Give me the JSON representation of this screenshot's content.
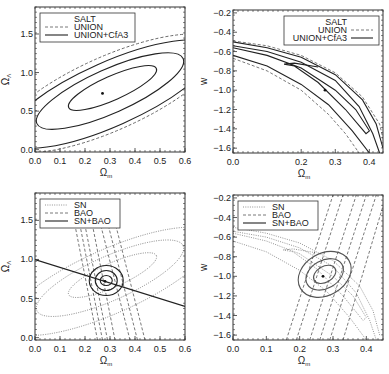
{
  "chart_data": [
    {
      "type": "line",
      "panel": "top-left",
      "title": "",
      "xlabel": "Ωm",
      "ylabel": "ΩΛ",
      "xlim": [
        0.0,
        0.6
      ],
      "ylim": [
        -0.03,
        1.85
      ],
      "xticks": [
        "0.0",
        "0.1",
        "0.2",
        "0.3",
        "0.4",
        "0.5",
        "0.6"
      ],
      "yticks": [
        "0.0",
        "0.5",
        "1.0",
        "1.5"
      ],
      "legend": {
        "position": "upper left",
        "entries": [
          {
            "label": "SALT",
            "style": "none"
          },
          {
            "label": "UNION",
            "style": "dashed"
          },
          {
            "label": "UNION+CfA3",
            "style": "solid"
          }
        ]
      },
      "best_fit": {
        "x": 0.27,
        "y": 0.73
      },
      "contours": [
        {
          "series": "UNION+CfA3",
          "level": "1σ",
          "cx": 0.31,
          "cy": 0.8,
          "half_major": 0.16,
          "half_minor": 0.075,
          "angle_deg": 30
        },
        {
          "series": "UNION+CfA3",
          "level": "2σ",
          "cx": 0.3,
          "cy": 0.76,
          "half_major": 0.3,
          "half_minor": 0.13,
          "angle_deg": 30
        },
        {
          "series": "UNION+CfA3",
          "level": "3σ",
          "cx": 0.3,
          "cy": 0.73,
          "half_major": 0.42,
          "half_minor": 0.19,
          "angle_deg": 30
        },
        {
          "series": "UNION",
          "level": "3σ",
          "cx": 0.3,
          "cy": 0.74,
          "half_major": 0.46,
          "half_minor": 0.21,
          "angle_deg": 30
        }
      ]
    },
    {
      "type": "line",
      "panel": "top-right",
      "xlabel": "Ωm",
      "ylabel": "w",
      "xlim": [
        0.0,
        0.44
      ],
      "ylim": [
        -1.65,
        -0.17
      ],
      "xticks": [
        "0.0",
        "0.2",
        "0.3",
        "0.4"
      ],
      "yticks": [
        "-0.2",
        "-0.4",
        "-0.6",
        "-0.8",
        "-1.0",
        "-1.2",
        "-1.4",
        "-1.6"
      ],
      "legend": {
        "position": "upper right",
        "entries": [
          {
            "label": "SALT",
            "style": "none"
          },
          {
            "label": "UNION",
            "style": "dashed"
          },
          {
            "label": "UNION+CfA3",
            "style": "solid"
          }
        ]
      },
      "best_fit": {
        "x": 0.27,
        "y": -1.0
      },
      "bands": [
        {
          "series": "UNION+CfA3",
          "level": "outer-upper",
          "points": [
            [
              0.0,
              -0.5
            ],
            [
              0.1,
              -0.56
            ],
            [
              0.2,
              -0.66
            ],
            [
              0.3,
              -0.84
            ],
            [
              0.38,
              -1.1
            ],
            [
              0.42,
              -1.35
            ],
            [
              0.44,
              -1.6
            ]
          ]
        },
        {
          "series": "UNION+CfA3",
          "level": "mid-upper",
          "points": [
            [
              0.0,
              -0.54
            ],
            [
              0.1,
              -0.6
            ],
            [
              0.2,
              -0.71
            ],
            [
              0.3,
              -0.9
            ],
            [
              0.37,
              -1.17
            ],
            [
              0.41,
              -1.45
            ],
            [
              0.43,
              -1.65
            ]
          ]
        },
        {
          "series": "UNION+CfA3",
          "level": "mid-lower",
          "points": [
            [
              0.0,
              -0.64
            ],
            [
              0.1,
              -0.75
            ],
            [
              0.2,
              -0.94
            ],
            [
              0.28,
              -1.15
            ],
            [
              0.35,
              -1.42
            ],
            [
              0.4,
              -1.65
            ]
          ]
        },
        {
          "series": "UNION+CfA3",
          "level": "inner",
          "points": [
            [
              0.0,
              -0.56
            ],
            [
              0.1,
              -0.64
            ],
            [
              0.2,
              -0.77
            ],
            [
              0.3,
              -1.0
            ],
            [
              0.36,
              -1.2
            ],
            [
              0.4,
              -1.42
            ],
            [
              0.39,
              -1.45
            ],
            [
              0.33,
              -1.2
            ],
            [
              0.25,
              -0.92
            ],
            [
              0.18,
              -0.75
            ],
            [
              0.15,
              -0.73
            ],
            [
              0.18,
              -0.72
            ],
            [
              0.25,
              -0.76
            ]
          ]
        },
        {
          "series": "UNION",
          "level": "outer-upper",
          "points": [
            [
              0.0,
              -0.49
            ],
            [
              0.1,
              -0.54
            ],
            [
              0.2,
              -0.64
            ],
            [
              0.3,
              -0.82
            ],
            [
              0.38,
              -1.07
            ],
            [
              0.43,
              -1.35
            ],
            [
              0.44,
              -1.5
            ]
          ]
        },
        {
          "series": "UNION",
          "level": "outer-lower",
          "points": [
            [
              0.0,
              -0.67
            ],
            [
              0.1,
              -0.8
            ],
            [
              0.2,
              -1.0
            ],
            [
              0.28,
              -1.25
            ],
            [
              0.33,
              -1.45
            ],
            [
              0.37,
              -1.65
            ]
          ]
        }
      ]
    },
    {
      "type": "line",
      "panel": "bottom-left",
      "xlabel": "Ωm",
      "ylabel": "ΩΛ",
      "xlim": [
        0.0,
        0.6
      ],
      "ylim": [
        -0.03,
        1.85
      ],
      "xticks": [
        "0.0",
        "0.1",
        "0.2",
        "0.3",
        "0.4",
        "0.5",
        "0.6"
      ],
      "yticks": [
        "0.0",
        "0.5",
        "1.0",
        "1.5"
      ],
      "legend": {
        "position": "upper left",
        "entries": [
          {
            "label": "SN",
            "style": "dotted"
          },
          {
            "label": "BAO",
            "style": "dashed"
          },
          {
            "label": "SN+BAO",
            "style": "solid"
          }
        ]
      },
      "best_fit": {
        "x": 0.28,
        "y": 0.72
      },
      "flat_line": {
        "points": [
          [
            0.0,
            1.0
          ],
          [
            0.6,
            0.4
          ]
        ],
        "label": "ΩΛ = 1 - Ωm"
      },
      "bao_bands": [
        {
          "bottom_x": 0.25,
          "top_x": 0.15
        },
        {
          "bottom_x": 0.27,
          "top_x": 0.17
        },
        {
          "bottom_x": 0.29,
          "top_x": 0.19
        },
        {
          "bottom_x": 0.32,
          "top_x": 0.22
        },
        {
          "bottom_x": 0.38,
          "top_x": 0.25
        },
        {
          "bottom_x": 0.41,
          "top_x": 0.28
        },
        {
          "bottom_x": 0.44,
          "top_x": 0.31
        }
      ]
    },
    {
      "type": "line",
      "panel": "bottom-right",
      "xlabel": "Ωm",
      "ylabel": "w",
      "xlim": [
        0.0,
        0.45
      ],
      "ylim": [
        -1.65,
        -0.17
      ],
      "xticks": [
        "0.0",
        "0.1",
        "0.2",
        "0.3",
        "0.4"
      ],
      "yticks": [
        "-0.2",
        "-0.4",
        "-0.6",
        "-0.8",
        "-1.0",
        "-1.2",
        "-1.4",
        "-1.6"
      ],
      "legend": {
        "position": "upper left",
        "entries": [
          {
            "label": "SN",
            "style": "dotted"
          },
          {
            "label": "BAO",
            "style": "dashed"
          },
          {
            "label": "SN+BAO",
            "style": "solid"
          }
        ]
      },
      "best_fit": {
        "x": 0.27,
        "y": -1.0
      },
      "bao_bands": [
        {
          "bottom_x": 0.16,
          "top_x": 0.3
        },
        {
          "bottom_x": 0.19,
          "top_x": 0.33
        },
        {
          "bottom_x": 0.23,
          "top_x": 0.37
        },
        {
          "bottom_x": 0.26,
          "top_x": 0.4
        },
        {
          "bottom_x": 0.29,
          "top_x": 0.43
        },
        {
          "bottom_x": 0.33,
          "top_x": 0.46
        }
      ]
    }
  ],
  "panels": {
    "tl": {
      "ylabel": "ΩΛ",
      "xlabel": "Ωm",
      "legend": [
        "SALT",
        "UNION",
        "UNION+CfA3"
      ]
    },
    "tr": {
      "ylabel": "w",
      "xlabel": "Ωm",
      "legend": [
        "SALT",
        "UNION",
        "UNION+CfA3"
      ]
    },
    "bl": {
      "ylabel": "ΩΛ",
      "xlabel": "Ωm",
      "legend": [
        "SN",
        "BAO",
        "SN+BAO"
      ]
    },
    "br": {
      "ylabel": "w",
      "xlabel": "Ωm",
      "legend": [
        "SN",
        "BAO",
        "SN+BAO"
      ]
    }
  },
  "colors": {
    "axis": "#333333",
    "solid": "#222222",
    "dashed": "#555555",
    "dotted": "#666666"
  }
}
